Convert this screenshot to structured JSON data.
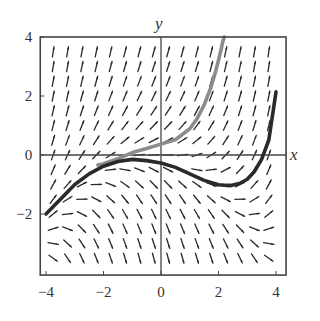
{
  "chart_data": {
    "type": "slope-field",
    "title": "",
    "xlabel": "x",
    "ylabel": "y",
    "xlim": [
      -4.2,
      4.35
    ],
    "ylim": [
      -4.07,
      4.0
    ],
    "grid": false,
    "legend": null,
    "x_ticks": [
      -4,
      -2,
      0,
      2,
      4
    ],
    "y_ticks": [
      -2,
      0,
      2,
      4
    ],
    "x_tick_labels": [
      "−4",
      "−2",
      "0",
      "2",
      "4"
    ],
    "y_tick_labels": [
      "−2",
      "0",
      "2",
      "4"
    ],
    "slope_field": {
      "equation": "dy/dx = 0.2x^2 + y",
      "x_start": -3.75,
      "x_end": 3.75,
      "x_step": 0.5,
      "y_start": -3.5,
      "y_end": 3.5,
      "y_step": 0.5,
      "segment_color": "#2a2a2a"
    },
    "series": [
      {
        "name": "gray solution curve",
        "color": "#8c8c8c",
        "points": [
          [
            -2.2,
            -0.34
          ],
          [
            -2.0,
            -0.3
          ],
          [
            -1.5,
            -0.13
          ],
          [
            -1.0,
            0.08
          ],
          [
            -0.5,
            0.22
          ],
          [
            0.0,
            0.37
          ],
          [
            0.5,
            0.52
          ],
          [
            1.0,
            0.89
          ],
          [
            1.25,
            1.22
          ],
          [
            1.5,
            1.69
          ],
          [
            1.75,
            2.33
          ],
          [
            1.9,
            2.83
          ],
          [
            2.0,
            3.21
          ],
          [
            2.1,
            3.62
          ],
          [
            2.15,
            3.85
          ],
          [
            2.2,
            4.0
          ]
        ]
      },
      {
        "name": "dark solution curve",
        "color": "#2a2a2a",
        "points": [
          [
            -4.0,
            -2.0
          ],
          [
            -3.5,
            -1.5
          ],
          [
            -3.0,
            -1.0
          ],
          [
            -2.5,
            -0.64
          ],
          [
            -2.0,
            -0.38
          ],
          [
            -1.5,
            -0.22
          ],
          [
            -1.0,
            -0.15
          ],
          [
            -0.5,
            -0.19
          ],
          [
            0.0,
            -0.27
          ],
          [
            0.5,
            -0.42
          ],
          [
            1.0,
            -0.64
          ],
          [
            1.5,
            -0.86
          ],
          [
            2.0,
            -1.01
          ],
          [
            2.4,
            -1.04
          ],
          [
            2.75,
            -0.96
          ],
          [
            3.0,
            -0.82
          ],
          [
            3.25,
            -0.56
          ],
          [
            3.5,
            -0.15
          ],
          [
            3.75,
            0.51
          ],
          [
            4.0,
            2.14
          ]
        ]
      }
    ]
  },
  "axes": {
    "x_label": "x",
    "y_label": "y"
  }
}
